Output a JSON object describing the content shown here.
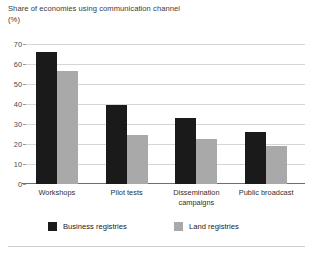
{
  "chart_data": {
    "type": "bar",
    "title": "Share of economies using communication channel",
    "subtitle": "(%)",
    "xlabel": "",
    "ylabel": "",
    "ylim": [
      0,
      70
    ],
    "yticks": [
      0,
      10,
      20,
      30,
      40,
      50,
      60,
      70
    ],
    "ytick_labels": [
      "0",
      "10",
      "20",
      "30",
      "40",
      "50",
      "60",
      "70"
    ],
    "grid": true,
    "legend_position": "bottom",
    "categories": [
      "Workshops",
      "Pilot tests",
      "Dissemination campaigns",
      "Public broadcast"
    ],
    "category_lines": [
      [
        "Workshops"
      ],
      [
        "Pilot tests"
      ],
      [
        "Dissemination",
        "campaigns"
      ],
      [
        "Public broadcast"
      ]
    ],
    "series": [
      {
        "name": "Business registries",
        "color": "#1a1a1a",
        "values": [
          66,
          39.5,
          33,
          26
        ]
      },
      {
        "name": "Land registries",
        "color": "#a9a9a9",
        "values": [
          56.5,
          24.5,
          22.5,
          19
        ]
      }
    ]
  }
}
